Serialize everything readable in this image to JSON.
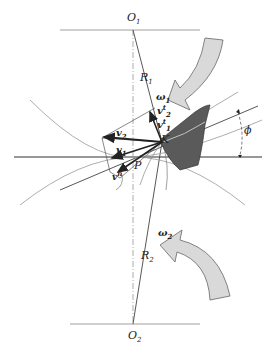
{
  "diagram": {
    "labels": {
      "O1": "O",
      "O1_sub": "1",
      "O2": "O",
      "O2_sub": "2",
      "R1": "R",
      "R1_sub": "1",
      "R2": "R",
      "R2_sub": "2",
      "omega1": "ω",
      "omega1_sub": "1",
      "omega2": "ω",
      "omega2_sub": "2",
      "vt2": "v",
      "vt2_sup": "t",
      "vt2_sub": "2",
      "vt1": "v",
      "vt1_sup": "t",
      "vt1_sub": "1",
      "v2": "v",
      "v2_sub": "2",
      "v1": "v",
      "v1_sub": "1",
      "vn": "v",
      "vn_sup": "n",
      "P": "P",
      "K": "K",
      "phi": "ϕ"
    },
    "colors": {
      "line": "#333333",
      "thin": "#777777",
      "tooth": "#555555",
      "arrow_fill": "#d9d9d9"
    }
  }
}
